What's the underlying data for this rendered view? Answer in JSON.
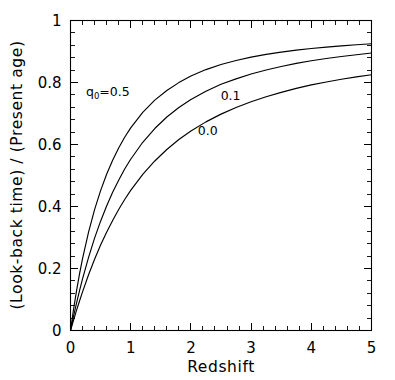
{
  "figure": {
    "background_color": "#ffffff",
    "line_color": "#000000",
    "xlabel": "Redshift",
    "ylabel": "(Look-back time) / (Present age)"
  },
  "chart_data": {
    "type": "line",
    "title": "",
    "subtitle": "",
    "xlabel": "Redshift",
    "ylabel": "(Look-back time) / (Present age)",
    "xlim": [
      0,
      5
    ],
    "ylim": [
      0,
      1
    ],
    "xticks": [
      0,
      1,
      2,
      3,
      4,
      5
    ],
    "xticklabels": [
      "0",
      "1",
      "2",
      "3",
      "4",
      "5"
    ],
    "yticks": [
      0,
      0.2,
      0.4,
      0.6,
      0.8,
      1
    ],
    "yticklabels": [
      "0",
      "0.2",
      "0.4",
      "0.6",
      "0.8",
      "1"
    ],
    "x_minor_tick_count": 4,
    "y_minor_tick_count": 4,
    "grid": false,
    "legend_position": "inline-annotations",
    "ticks_direction": "in",
    "ticks_all_sides": true,
    "annotations": [
      {
        "name": "q0-0.5-label",
        "text": "q₀=0.5",
        "base": "q",
        "subscript": "0",
        "suffix": "=0.5",
        "x": 0.62,
        "y": 0.755
      },
      {
        "name": "q0-0.1-label",
        "text": "0.1",
        "x": 2.66,
        "y": 0.745
      },
      {
        "name": "q0-0.0-label",
        "text": "0.0",
        "x": 2.28,
        "y": 0.632
      }
    ],
    "series": [
      {
        "name": "q0=0.5",
        "label": "q₀=0.5",
        "x": [
          0,
          0.05,
          0.1,
          0.15,
          0.2,
          0.3,
          0.4,
          0.5,
          0.6,
          0.7,
          0.8,
          0.9,
          1.0,
          1.2,
          1.4,
          1.6,
          1.8,
          2.0,
          2.25,
          2.5,
          2.75,
          3.0,
          3.25,
          3.5,
          3.75,
          4.0,
          4.25,
          4.5,
          4.75,
          5.0
        ],
        "values": [
          0,
          0.072,
          0.136,
          0.194,
          0.246,
          0.337,
          0.414,
          0.479,
          0.535,
          0.583,
          0.625,
          0.662,
          0.694,
          0.747,
          0.789,
          0.822,
          0.849,
          0.8717,
          0.8936,
          0.9109,
          0.9248,
          0.9361,
          0.9455,
          0.9534,
          0.9601,
          0.9658,
          0.9707,
          0.975,
          0.9788,
          0.9821
        ]
      },
      {
        "name": "q0=0.1",
        "label": "0.1",
        "x": [
          0,
          0.05,
          0.1,
          0.15,
          0.2,
          0.3,
          0.4,
          0.5,
          0.6,
          0.7,
          0.8,
          0.9,
          1.0,
          1.2,
          1.4,
          1.6,
          1.8,
          2.0,
          2.25,
          2.5,
          2.75,
          3.0,
          3.25,
          3.5,
          3.75,
          4.0,
          4.25,
          4.5,
          4.75,
          5.0
        ],
        "values": [
          0,
          0.049,
          0.095,
          0.139,
          0.18,
          0.255,
          0.322,
          0.381,
          0.434,
          0.482,
          0.524,
          0.563,
          0.597,
          0.656,
          0.704,
          0.744,
          0.777,
          0.805,
          0.834,
          0.858,
          0.877,
          0.894,
          0.908,
          0.92,
          0.931,
          0.94,
          0.948,
          0.955,
          0.961,
          0.967
        ]
      },
      {
        "name": "q0=0.0",
        "label": "0.0",
        "x": [
          0,
          0.05,
          0.1,
          0.15,
          0.2,
          0.3,
          0.4,
          0.5,
          0.6,
          0.7,
          0.8,
          0.9,
          1.0,
          1.2,
          1.4,
          1.6,
          1.8,
          2.0,
          2.25,
          2.5,
          2.75,
          3.0,
          3.25,
          3.5,
          3.75,
          4.0,
          4.25,
          4.5,
          4.75,
          5.0
        ],
        "values": [
          0,
          0.038,
          0.075,
          0.11,
          0.144,
          0.208,
          0.266,
          0.319,
          0.367,
          0.411,
          0.452,
          0.489,
          0.523,
          0.583,
          0.633,
          0.676,
          0.713,
          0.745,
          0.779,
          0.808,
          0.833,
          0.854,
          0.873,
          0.889,
          0.904,
          0.917,
          0.928,
          0.938,
          0.947,
          0.955
        ]
      }
    ],
    "curve_pixel_endpoints_at_xmax": {
      "q0=0.5": 0.925,
      "q0=0.1": 0.895,
      "q0=0.0": 0.825
    },
    "scale_note": "plotted values are normalized look-back time fractions reaching 0.925 / 0.895 / 0.825 at z=5"
  }
}
